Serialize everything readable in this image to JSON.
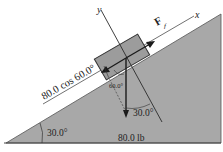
{
  "diagram": {
    "type": "free-body diagram, block on inclined plane",
    "labels": {
      "y_axis": "y",
      "x_axis": "x",
      "friction_force": "F",
      "friction_subscript": "f",
      "parallel_component": "80.0 cos 60.0°",
      "angle_block": "60.0°",
      "angle_weight": "30.0°",
      "incline_angle": "30.0°",
      "weight": "80.0 lb"
    },
    "colors": {
      "incline_fill": "#a8a8a8",
      "block_fill": "#9c9c9c",
      "line": "#2a2a2a",
      "background": "#ffffff"
    }
  }
}
